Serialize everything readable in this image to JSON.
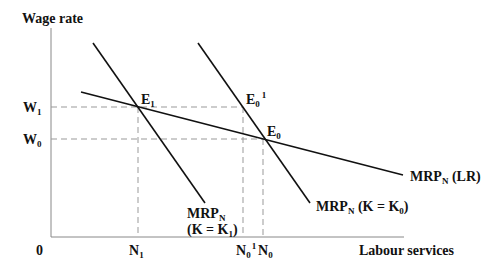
{
  "diagram": {
    "y_axis_label": "Wage rate",
    "x_axis_label": "Labour services",
    "origin_label": "0",
    "wage_levels": [
      {
        "main": "W",
        "sub": "1"
      },
      {
        "main": "W",
        "sub": "0"
      }
    ],
    "quantity_levels": [
      {
        "main": "N",
        "sub": "1",
        "sup": ""
      },
      {
        "main": "N",
        "sub": "0",
        "sup": "1"
      },
      {
        "main": "N",
        "sub": "0",
        "sup": ""
      }
    ],
    "points": [
      {
        "main": "E",
        "sub": "1",
        "sup": ""
      },
      {
        "main": "E",
        "sub": "0",
        "sup": "1"
      },
      {
        "main": "E",
        "sub": "0",
        "sup": ""
      }
    ],
    "curves": {
      "short_run_k1": {
        "line1_main": "MRP",
        "line1_sub": "N",
        "line2_a": "(K = K",
        "line2_sub": "1",
        "line2_b": ")"
      },
      "short_run_k0": {
        "main": "MRP",
        "sub": "N",
        "a": " (K = K",
        "k_sub": "0",
        "b": ")"
      },
      "long_run": {
        "main": "MRP",
        "sub": "N",
        "a": " (LR)"
      }
    }
  }
}
